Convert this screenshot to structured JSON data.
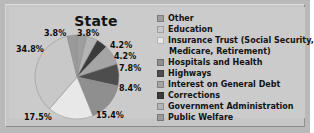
{
  "chart_data": {
    "type": "pie",
    "title": "State",
    "xlabel": "",
    "ylabel": "",
    "legend_position": "right",
    "grid": false,
    "categories": [
      "Other",
      "Education",
      "Insurance Trust (Social Security, Medicare, Retirement)",
      "Hospitals and Health",
      "Highways",
      "Interest on General Debt",
      "Corrections",
      "Government Administration",
      "Public Welfare"
    ],
    "values": [
      3.8,
      34.8,
      17.5,
      15.4,
      8.4,
      7.8,
      4.2,
      4.2,
      3.8
    ],
    "value_labels": [
      "3.8%",
      "34.8%",
      "17.5%",
      "15.4%",
      "8.4%",
      "7.8%",
      "4.2%",
      "4.2%",
      "3.8%"
    ],
    "unit": "%",
    "colors": [
      "#9e9e9e",
      "#c8c8c8",
      "#e8e8e8",
      "#8f8f8f",
      "#4d4d4d",
      "#a5a5a5",
      "#3b3b3b",
      "#b4b4b4",
      "#9a9a9a"
    ]
  },
  "chart": {
    "title": "State"
  },
  "legend": {
    "items": [
      {
        "label": "Other",
        "color": "#9e9e9e"
      },
      {
        "label": "Education",
        "color": "#c8c8c8"
      },
      {
        "label": "Insurance Trust (Social Security,",
        "label2": "Medicare, Retirement)",
        "color": "#e8e8e8"
      },
      {
        "label": "Hospitals and Health",
        "color": "#8f8f8f"
      },
      {
        "label": "Highways",
        "color": "#4d4d4d"
      },
      {
        "label": "Interest on General Debt",
        "color": "#a5a5a5"
      },
      {
        "label": "Corrections",
        "color": "#3b3b3b"
      },
      {
        "label": "Government Administration",
        "color": "#b4b4b4"
      },
      {
        "label": "Public Welfare",
        "color": "#9a9a9a"
      }
    ]
  },
  "pie_labels": [
    {
      "text": "3.8%",
      "left": 29,
      "top": 2
    },
    {
      "text": "3.8%",
      "left": 62,
      "top": 2
    },
    {
      "text": "4.2%",
      "left": 95,
      "top": 14
    },
    {
      "text": "4.2%",
      "left": 99,
      "top": 25
    },
    {
      "text": "7.8%",
      "left": 104,
      "top": 37
    },
    {
      "text": "8.4%",
      "left": 104,
      "top": 57
    },
    {
      "text": "15.4%",
      "left": 81,
      "top": 84
    },
    {
      "text": "17.5%",
      "left": 9,
      "top": 86
    },
    {
      "text": "34.8%",
      "left": 1,
      "top": 18
    }
  ]
}
